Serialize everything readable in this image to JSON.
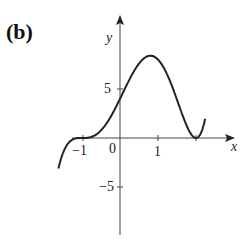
{
  "panel_label": "(b)",
  "axis": {
    "x_label": "x",
    "y_label": "y"
  },
  "ticks": {
    "x": [
      {
        "value": -1,
        "label": "−1"
      },
      {
        "value": 0,
        "label": "0"
      },
      {
        "value": 1,
        "label": "1"
      },
      {
        "value": 2,
        "label": ""
      }
    ],
    "y": [
      {
        "value": 5,
        "label": "5"
      },
      {
        "value": -5,
        "label": "−5"
      }
    ]
  },
  "chart_data": {
    "type": "line",
    "title": "(b)",
    "xlabel": "x",
    "ylabel": "y",
    "function": "(x+1)^3 (x-2)^2",
    "xlim": [
      -2.1,
      2.3
    ],
    "ylim": [
      -12.5,
      11
    ],
    "x_ticks": [
      -1,
      0,
      1,
      2
    ],
    "y_ticks": [
      -5,
      5
    ],
    "grid": false,
    "series": [
      {
        "name": "f(x)",
        "x": [
          -1.6,
          -1.4,
          -1.2,
          -1.0,
          -0.8,
          -0.5,
          0,
          0.5,
          0.8,
          1.0,
          1.5,
          2.0,
          2.2
        ],
        "y": [
          -12.2,
          -3.7,
          -0.08,
          0,
          0.08,
          0.78,
          4.0,
          7.6,
          8.4,
          8.0,
          3.9,
          0,
          1.3
        ]
      }
    ],
    "annotations": [
      "inflection/triple root at x=-1",
      "double root at x=2",
      "local max ≈ 8.4 near x≈0.8"
    ]
  }
}
